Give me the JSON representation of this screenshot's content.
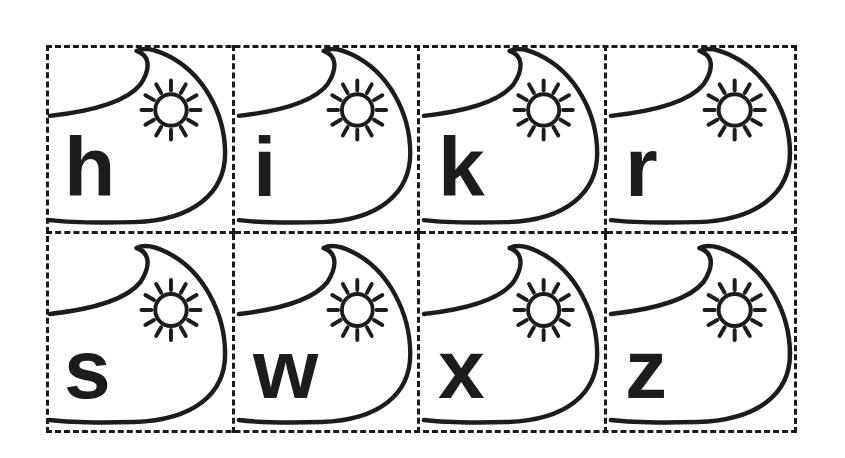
{
  "sheet": {
    "description": "Cut-out letter cards with wave and sun illustration",
    "line_color": "#1c1c1c",
    "background": "#ffffff",
    "cards": [
      {
        "letter": "h",
        "icon": "wave-sun-icon"
      },
      {
        "letter": "i",
        "icon": "wave-sun-icon"
      },
      {
        "letter": "k",
        "icon": "wave-sun-icon"
      },
      {
        "letter": "r",
        "icon": "wave-sun-icon"
      },
      {
        "letter": "s",
        "icon": "wave-sun-icon"
      },
      {
        "letter": "w",
        "icon": "wave-sun-icon"
      },
      {
        "letter": "x",
        "icon": "wave-sun-icon"
      },
      {
        "letter": "z",
        "icon": "wave-sun-icon"
      }
    ]
  }
}
